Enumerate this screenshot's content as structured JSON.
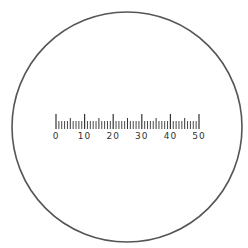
{
  "diagram": {
    "type": "eyepiece-reticle-scale",
    "field_of_view": {
      "shape": "circle",
      "center": [
        127,
        127
      ],
      "radius": 115,
      "stroke_color": "#555555",
      "fill_color": "#ffffff"
    },
    "scale": {
      "start_value": 0,
      "end_value": 50,
      "minor_step": 1,
      "mid_step": 5,
      "major_step": 10,
      "x_start": 56,
      "x_end": 199,
      "baseline_y": 129,
      "major_tick_len": 15,
      "mid_tick_len": 11,
      "minor_tick_len": 8,
      "tick_color": "#333333",
      "labels": [
        "0",
        "10",
        "20",
        "30",
        "40",
        "50"
      ],
      "label_y": 139,
      "label_color": "#333333"
    }
  }
}
